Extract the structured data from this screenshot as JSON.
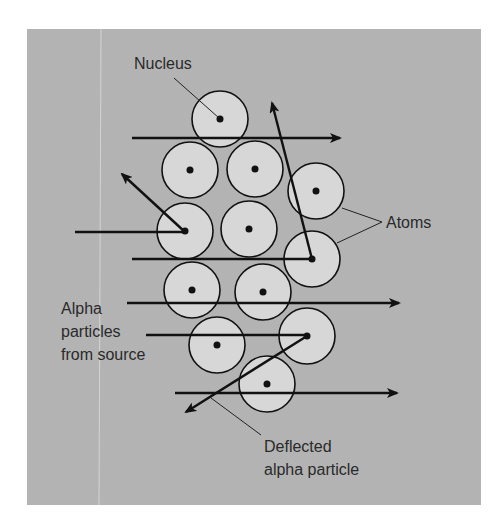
{
  "diagram": {
    "labels": {
      "nucleus": "Nucleus",
      "atoms": "Atoms",
      "alpha_source": [
        "Alpha",
        "particles",
        "from source"
      ],
      "deflected": [
        "Deflected",
        "alpha particle"
      ]
    },
    "colors": {
      "panel": "#b4b4b4",
      "atom_fill": "#d7d7d7",
      "stroke": "#111111",
      "text": "#2a2a2a",
      "background": "#ffffff"
    },
    "panel": {
      "x": 27,
      "y": 29,
      "width": 454,
      "height": 476
    },
    "atom_radius": 28,
    "atoms": [
      {
        "cx": 220,
        "cy": 119
      },
      {
        "cx": 190,
        "cy": 170
      },
      {
        "cx": 255,
        "cy": 169
      },
      {
        "cx": 316,
        "cy": 191
      },
      {
        "cx": 185,
        "cy": 231
      },
      {
        "cx": 249,
        "cy": 229
      },
      {
        "cx": 312,
        "cy": 259
      },
      {
        "cx": 192,
        "cy": 290
      },
      {
        "cx": 263,
        "cy": 292
      },
      {
        "cx": 217,
        "cy": 345
      },
      {
        "cx": 307,
        "cy": 336
      },
      {
        "cx": 267,
        "cy": 384
      }
    ],
    "paths": [
      {
        "type": "straight",
        "x1": 132,
        "y1": 138,
        "x2": 340,
        "y2": 138
      },
      {
        "type": "incoming",
        "x1": 75,
        "y1": 232,
        "x2": 185,
        "y2": 232
      },
      {
        "type": "deflected",
        "x1": 185,
        "y1": 232,
        "x2": 122,
        "y2": 174
      },
      {
        "type": "incoming",
        "x1": 132,
        "y1": 259,
        "x2": 312,
        "y2": 259
      },
      {
        "type": "deflected",
        "x1": 312,
        "y1": 259,
        "x2": 272,
        "y2": 103
      },
      {
        "type": "straight",
        "x1": 127,
        "y1": 303,
        "x2": 399,
        "y2": 303
      },
      {
        "type": "incoming",
        "x1": 146,
        "y1": 335,
        "x2": 307,
        "y2": 335
      },
      {
        "type": "deflected",
        "x1": 307,
        "y1": 336,
        "x2": 186,
        "y2": 412
      },
      {
        "type": "straight",
        "x1": 175,
        "y1": 393,
        "x2": 397,
        "y2": 393
      }
    ]
  }
}
